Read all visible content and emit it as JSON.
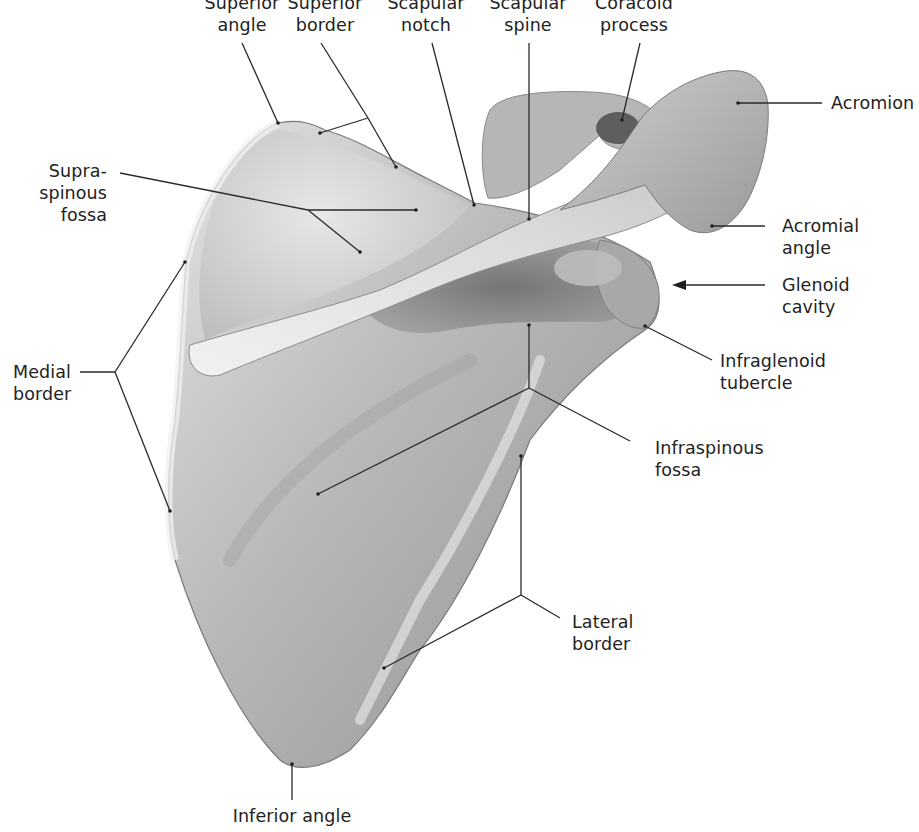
{
  "figure": {
    "colors": {
      "background": "#ffffff",
      "bone_light": "#e6e6e6",
      "bone_mid": "#b9b9b9",
      "bone_dark": "#6e6e6e",
      "leader_line": "#2a2a2a",
      "label_text": "#222222"
    }
  },
  "labels": {
    "superior_angle": {
      "line1": "Superior",
      "line2": "angle"
    },
    "superior_border": {
      "line1": "Superior",
      "line2": "border"
    },
    "scapular_notch": {
      "line1": "Scapular",
      "line2": "notch"
    },
    "scapular_spine": {
      "line1": "Scapular",
      "line2": "spine"
    },
    "coracoid_process": {
      "line1": "Coracoid",
      "line2": "process"
    },
    "acromion": {
      "line1": "Acromion"
    },
    "supraspinous_fossa": {
      "line1": "Supra-",
      "line2": "spinous",
      "line3": "fossa"
    },
    "acromial_angle": {
      "line1": "Acromial",
      "line2": "angle"
    },
    "glenoid_cavity": {
      "line1": "Glenoid",
      "line2": "cavity"
    },
    "infraglenoid_tubercle": {
      "line1": "Infraglenoid",
      "line2": "tubercle"
    },
    "medial_border": {
      "line1": "Medial",
      "line2": "border"
    },
    "infraspinous_fossa": {
      "line1": "Infraspinous",
      "line2": "fossa"
    },
    "lateral_border": {
      "line1": "Lateral",
      "line2": "border"
    },
    "inferior_angle": {
      "line1": "Inferior angle"
    }
  }
}
